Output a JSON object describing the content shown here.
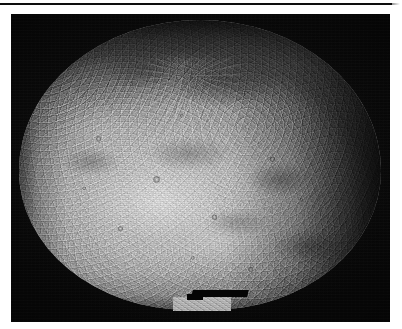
{
  "page": {
    "background_color": "#ffffff",
    "width": 402,
    "height": 329
  },
  "rule": {
    "name": "top-horizontal-rule",
    "color": "#0d0d0d"
  },
  "margin": {
    "rotated_text": "· · · · · · · · ·"
  },
  "figure": {
    "alt": "Grayscale spacecraft photomosaic of a heavily cratered planetary body",
    "background_color": "#0a0a0a",
    "surface_color": "#bdbdbd",
    "shadow_color": "#080808",
    "features": {
      "ray_crater_north": "bright ray crater with radial ejecta, upper centre",
      "ray_crater_central": "bright ray crater system, centre",
      "terminator": "dark shadowed limb along the right edge",
      "north_limb": "dark shadowed limb along the top edge",
      "data_gap": "black rectangular data-gap bar near bottom centre",
      "mosaic_tab": "protruding frame tab at bottom centre"
    }
  }
}
